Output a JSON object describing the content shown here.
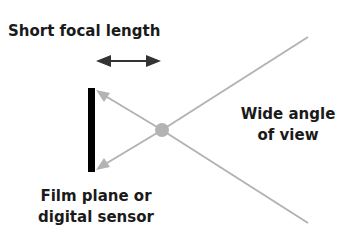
{
  "labels": {
    "short_focal_length": "Short focal length",
    "wide_angle_line1": "Wide angle",
    "wide_angle_line2": "of view",
    "film_plane_line1": "Film plane or",
    "film_plane_line2": "digital sensor"
  },
  "colors": {
    "ray": "#b3b3b3",
    "sensor": "#000000",
    "focal_arrow": "#333333",
    "text": "#1a1a1a",
    "background": "#ffffff"
  },
  "geometry": {
    "lens_center": [
      162,
      130
    ],
    "ray_upper_end": [
      308,
      37
    ],
    "ray_lower_end": [
      308,
      223
    ],
    "sensor_top": [
      91,
      88
    ],
    "sensor_bottom": [
      91,
      172
    ],
    "focal_arrow_span": [
      96,
      161,
      61
    ]
  }
}
